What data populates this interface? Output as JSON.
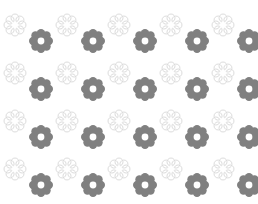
{
  "canvas": {
    "width": 258,
    "height": 204,
    "background_color": "#ffffff",
    "description": "Seamless decorative floral pattern"
  },
  "palette": {
    "background": "#ffffff",
    "outline_flower_stroke": "#dcdcdc",
    "outline_flower_fill": "#ffffff",
    "solid_gear_fill": "#808080"
  },
  "motifs": {
    "outline_flower": {
      "name": "outline-flower",
      "petal_count": 8,
      "outer_radius": 11,
      "petal_radius": 4.0,
      "stroke_width": 1,
      "stroke_color": "#dcdcdc",
      "fill_color": "#ffffff",
      "has_center_hole": false
    },
    "solid_gear_flower": {
      "name": "solid-gear-flower",
      "petal_count": 8,
      "outer_radius": 12,
      "petal_radius": 4.2,
      "inner_radius": 6.5,
      "center_hole_radius": 3.4,
      "fill_color": "#808080",
      "has_center_hole": true
    }
  },
  "grid": {
    "column_spacing": 52,
    "row_spacing": 48,
    "outline_flower_origin_x": 15,
    "outline_flower_origin_y": 25,
    "gear_offset_x": 26,
    "gear_offset_y": 16,
    "columns": 5,
    "rows": 4
  },
  "outline_flower_positions": [
    {
      "x": 15,
      "y": 25
    },
    {
      "x": 67,
      "y": 25
    },
    {
      "x": 119,
      "y": 25
    },
    {
      "x": 171,
      "y": 25
    },
    {
      "x": 223,
      "y": 25
    },
    {
      "x": 15,
      "y": 73
    },
    {
      "x": 67,
      "y": 73
    },
    {
      "x": 119,
      "y": 73
    },
    {
      "x": 171,
      "y": 73
    },
    {
      "x": 223,
      "y": 73
    },
    {
      "x": 15,
      "y": 121
    },
    {
      "x": 67,
      "y": 121
    },
    {
      "x": 119,
      "y": 121
    },
    {
      "x": 171,
      "y": 121
    },
    {
      "x": 223,
      "y": 121
    },
    {
      "x": 15,
      "y": 169
    },
    {
      "x": 67,
      "y": 169
    },
    {
      "x": 119,
      "y": 169
    },
    {
      "x": 171,
      "y": 169
    },
    {
      "x": 223,
      "y": 169
    }
  ],
  "solid_gear_positions": [
    {
      "x": 41,
      "y": 41
    },
    {
      "x": 93,
      "y": 41
    },
    {
      "x": 145,
      "y": 41
    },
    {
      "x": 197,
      "y": 41
    },
    {
      "x": 249,
      "y": 41
    },
    {
      "x": 41,
      "y": 89
    },
    {
      "x": 93,
      "y": 89
    },
    {
      "x": 145,
      "y": 89
    },
    {
      "x": 197,
      "y": 89
    },
    {
      "x": 249,
      "y": 89
    },
    {
      "x": 41,
      "y": 137
    },
    {
      "x": 93,
      "y": 137
    },
    {
      "x": 145,
      "y": 137
    },
    {
      "x": 197,
      "y": 137
    },
    {
      "x": 249,
      "y": 137
    },
    {
      "x": 41,
      "y": 185
    },
    {
      "x": 93,
      "y": 185
    },
    {
      "x": 145,
      "y": 185
    },
    {
      "x": 197,
      "y": 185
    },
    {
      "x": 249,
      "y": 185
    }
  ],
  "accessibility": {
    "alt_text": "Repeating pattern of light outlined eight-petal flowers alternating with solid gray eight-tooth gear flowers on a white background"
  }
}
